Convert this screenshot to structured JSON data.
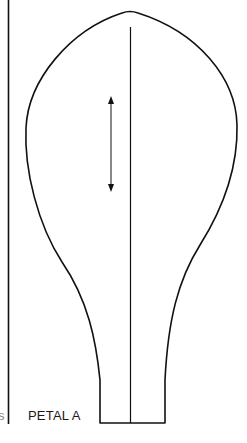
{
  "pattern": {
    "label": "PETAL A",
    "stray_mark": "s",
    "line_color": "#111111",
    "background": "#ffffff"
  },
  "elements": {
    "fold_line": "left vertical fold line",
    "outline": "petal outline",
    "center_line": "center vertical line",
    "grain_arrow": "double-headed grain arrow"
  }
}
